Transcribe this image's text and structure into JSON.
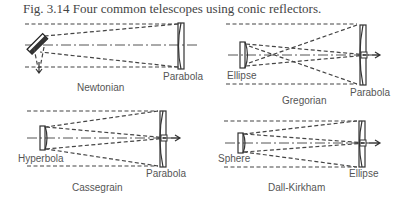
{
  "figure": {
    "caption": "Fig. 3.14 Four common telescopes using conic reflectors."
  },
  "telescopes": [
    {
      "name": "Newtonian",
      "labels": {
        "primary": "Parabola"
      }
    },
    {
      "name": "Gregorian",
      "labels": {
        "secondary": "Ellipse",
        "primary": "Parabola"
      }
    },
    {
      "name": "Cassegrain",
      "labels": {
        "secondary": "Hyperbola",
        "primary": "Parabola"
      }
    },
    {
      "name": "Dall-Kirkham",
      "labels": {
        "secondary": "Sphere",
        "primary": "Ellipse"
      }
    }
  ]
}
